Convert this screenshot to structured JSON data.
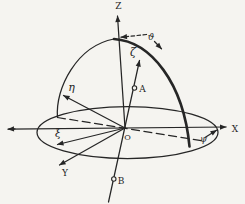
{
  "colors": {
    "ink": "#262626",
    "background": "#f5f4f0"
  },
  "labels": {
    "z_axis": "Z",
    "x_axis": "X",
    "y_axis": "Y",
    "zeta_axis": "ζ",
    "eta_axis": "η",
    "xi_axis": "ξ",
    "theta_angle": "ϑ",
    "psi_angle": "ψ",
    "point_a": "A",
    "point_b": "B",
    "origin": "O"
  }
}
